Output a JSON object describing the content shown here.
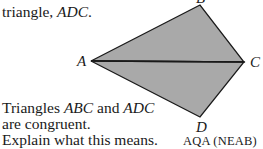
{
  "intro": {
    "prefix": "triangle, ",
    "name": "ADC",
    "suffix": "."
  },
  "figure": {
    "fill_color": "#a9a9a9",
    "vertices": {
      "A": {
        "label": "A",
        "x": 91,
        "y": 61
      },
      "B": {
        "label": "B",
        "x": 200,
        "y": 5
      },
      "C": {
        "label": "C",
        "x": 244,
        "y": 62
      },
      "D": {
        "label": "D",
        "x": 200,
        "y": 117
      }
    }
  },
  "question": {
    "line1_a": "Triangles ",
    "line1_b": "ABC",
    "line1_c": " and ",
    "line1_d": "ADC",
    "line2": "are congruent.",
    "line3": "Explain what this means."
  },
  "source": "AQA (NEAB)"
}
